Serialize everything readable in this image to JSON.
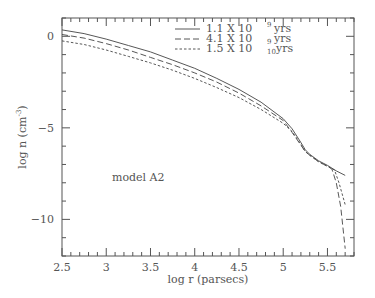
{
  "chart_data": {
    "type": "line",
    "title": "",
    "xlabel": "log r (parsecs)",
    "ylabel": "log n (cm^-3)",
    "ylabel_parts": {
      "main": "log n (cm",
      "sup": "-3",
      "close": ")"
    },
    "xlim": [
      2.5,
      5.8
    ],
    "ylim": [
      -12,
      1
    ],
    "x_ticks": [
      2.5,
      3,
      3.5,
      4,
      4.5,
      5,
      5.5
    ],
    "x_tick_labels": [
      "2.5",
      "3",
      "3.5",
      "4",
      "4.5",
      "5",
      "5.5"
    ],
    "y_ticks": [
      0,
      -5,
      -10
    ],
    "y_tick_labels": [
      "0",
      "-5",
      "-10"
    ],
    "grid": false,
    "legend_position": "upper right",
    "annotation": "model A2",
    "series": [
      {
        "name": "1.1 X 10^9 yrs",
        "label_parts": {
          "coef": "1.1",
          "base": "X  10",
          "exp": "9",
          "unit": "yrs"
        },
        "style": "solid",
        "x": [
          2.5,
          2.75,
          3.0,
          3.25,
          3.5,
          3.75,
          4.0,
          4.25,
          4.5,
          4.75,
          5.0,
          5.1,
          5.2,
          5.25,
          5.3,
          5.4,
          5.5,
          5.6,
          5.7
        ],
        "y": [
          0.35,
          0.15,
          -0.15,
          -0.5,
          -0.85,
          -1.3,
          -1.75,
          -2.3,
          -2.9,
          -3.6,
          -4.5,
          -5.05,
          -5.8,
          -6.2,
          -6.45,
          -6.8,
          -7.05,
          -7.35,
          -7.6
        ]
      },
      {
        "name": "4.1 X 10^9 yrs",
        "label_parts": {
          "coef": "4.1",
          "base": "X  10",
          "exp": "9",
          "unit": "yrs"
        },
        "style": "long-dash",
        "x": [
          2.5,
          2.75,
          3.0,
          3.25,
          3.5,
          3.75,
          4.0,
          4.25,
          4.5,
          4.75,
          5.0,
          5.1,
          5.2,
          5.25,
          5.3,
          5.4,
          5.5,
          5.55,
          5.6,
          5.65,
          5.7
        ],
        "y": [
          0.1,
          -0.1,
          -0.4,
          -0.75,
          -1.15,
          -1.55,
          -2.0,
          -2.5,
          -3.1,
          -3.8,
          -4.6,
          -5.25,
          -5.95,
          -6.3,
          -6.5,
          -6.85,
          -7.1,
          -7.25,
          -8.0,
          -9.3,
          -11.6
        ]
      },
      {
        "name": "1.5 X 10^10 yrs",
        "label_parts": {
          "coef": "1.5",
          "base": "X  10",
          "exp": "10",
          "unit": "yrs"
        },
        "style": "short-dash",
        "x": [
          2.5,
          2.75,
          3.0,
          3.25,
          3.5,
          3.75,
          4.0,
          4.25,
          4.5,
          4.75,
          5.0,
          5.1,
          5.2,
          5.25,
          5.3,
          5.4,
          5.5,
          5.58,
          5.63,
          5.7
        ],
        "y": [
          -0.25,
          -0.45,
          -0.75,
          -1.1,
          -1.45,
          -1.85,
          -2.3,
          -2.8,
          -3.35,
          -4.0,
          -4.75,
          -5.2,
          -5.9,
          -6.3,
          -6.5,
          -6.85,
          -7.1,
          -7.3,
          -8.0,
          -9.2
        ]
      }
    ]
  },
  "colors": {
    "axis": "#555555",
    "line": "#444444",
    "background": "#ffffff"
  }
}
